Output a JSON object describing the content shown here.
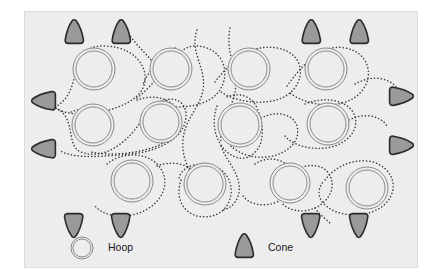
{
  "diagram": {
    "background_color": "#ededed",
    "border_color": "#dcdcdc",
    "panel": {
      "x": 24,
      "y": 11,
      "width": 394,
      "height": 257
    }
  },
  "legend": {
    "items": [
      {
        "icon": "hoop-icon",
        "label": "Hoop",
        "icon_x": 57,
        "icon_y": 236,
        "text_x": 83,
        "text_y": 236
      },
      {
        "icon": "cone-icon",
        "label": "Cone",
        "icon_x": 219,
        "icon_y": 234,
        "text_x": 243,
        "text_y": 236
      }
    ]
  },
  "styles": {
    "hoop_stroke": "#8a8a8a",
    "hoop_fill": "#ededed",
    "cone_fill": "#9a9a9a",
    "cone_stroke": "#2b2b2b",
    "path_dot_color": "#3c3c3c"
  },
  "chart_data": {
    "type": "diagram",
    "xlabel": "",
    "ylabel": "",
    "legend_position": "bottom-center",
    "grid": false,
    "hoops": [
      {
        "id": "h1",
        "cx": 69,
        "cy": 57,
        "r_outer": 21,
        "r_inner": 18,
        "row": "top"
      },
      {
        "id": "h2",
        "cx": 146,
        "cy": 57,
        "r_outer": 21,
        "r_inner": 18,
        "row": "top"
      },
      {
        "id": "h3",
        "cx": 224,
        "cy": 57,
        "r_outer": 21,
        "r_inner": 18,
        "row": "top"
      },
      {
        "id": "h4",
        "cx": 301,
        "cy": 57,
        "r_outer": 21,
        "r_inner": 18,
        "row": "top"
      },
      {
        "id": "h5",
        "cx": 68,
        "cy": 113,
        "r_outer": 21,
        "r_inner": 18,
        "row": "middle"
      },
      {
        "id": "h6",
        "cx": 136,
        "cy": 110,
        "r_outer": 21,
        "r_inner": 18,
        "row": "middle"
      },
      {
        "id": "h7",
        "cx": 215,
        "cy": 113,
        "r_outer": 22,
        "r_inner": 19,
        "row": "middle"
      },
      {
        "id": "h8",
        "cx": 303,
        "cy": 112,
        "r_outer": 21,
        "r_inner": 18,
        "row": "middle"
      },
      {
        "id": "h9",
        "cx": 107,
        "cy": 169,
        "r_outer": 21,
        "r_inner": 18,
        "row": "bottom"
      },
      {
        "id": "h10",
        "cx": 180,
        "cy": 172,
        "r_outer": 21,
        "r_inner": 18,
        "row": "bottom"
      },
      {
        "id": "h11",
        "cx": 265,
        "cy": 171,
        "r_outer": 20,
        "r_inner": 17,
        "row": "bottom"
      },
      {
        "id": "h12",
        "cx": 342,
        "cy": 176,
        "r_outer": 21,
        "r_inner": 18,
        "row": "bottom"
      }
    ],
    "cones": [
      {
        "id": "c1",
        "cx": 49,
        "cy": 20,
        "direction": "up",
        "side": "top"
      },
      {
        "id": "c2",
        "cx": 96,
        "cy": 20,
        "direction": "up",
        "side": "top"
      },
      {
        "id": "c3",
        "cx": 286,
        "cy": 20,
        "direction": "up",
        "side": "top"
      },
      {
        "id": "c4",
        "cx": 334,
        "cy": 20,
        "direction": "up",
        "side": "top"
      },
      {
        "id": "c5",
        "cx": 19,
        "cy": 89,
        "direction": "left",
        "side": "left"
      },
      {
        "id": "c6",
        "cx": 19,
        "cy": 137,
        "direction": "left",
        "side": "left"
      },
      {
        "id": "c7",
        "cx": 376,
        "cy": 84,
        "direction": "right",
        "side": "right"
      },
      {
        "id": "c8",
        "cx": 376,
        "cy": 133,
        "direction": "right",
        "side": "right"
      },
      {
        "id": "c9",
        "cx": 49,
        "cy": 213,
        "direction": "down",
        "side": "bottom"
      },
      {
        "id": "c10",
        "cx": 96,
        "cy": 213,
        "direction": "down",
        "side": "bottom"
      },
      {
        "id": "c11",
        "cx": 286,
        "cy": 213,
        "direction": "down",
        "side": "bottom"
      },
      {
        "id": "c12",
        "cx": 334,
        "cy": 213,
        "direction": "down",
        "side": "bottom"
      }
    ],
    "paths": [
      {
        "id": "p1",
        "d": "M 30 95 C 60 80 40 34 78 34 C 118 34 130 68 112 84 C 92 102 44 108 30 95 Z"
      },
      {
        "id": "p2",
        "d": "M 112 86 C 138 66 150 34 170 34 C 196 34 206 58 196 76 C 186 96 150 98 130 92"
      },
      {
        "id": "p3",
        "d": "M 172 18 C 164 40 182 56 178 78 C 174 98 160 106 158 128 C 156 152 170 162 172 180"
      },
      {
        "id": "p4",
        "d": "M 205 16 C 200 42 214 58 210 80 C 206 100 194 110 196 130"
      },
      {
        "id": "p5",
        "d": "M 190 70 C 210 44 230 32 252 36 C 276 40 282 62 268 78 C 252 96 214 92 196 80"
      },
      {
        "id": "p6",
        "d": "M 262 74 C 282 46 300 32 320 36 C 344 40 350 64 336 80 C 318 100 280 94 264 80"
      },
      {
        "id": "p7",
        "d": "M 330 72 C 348 62 364 66 372 76"
      },
      {
        "id": "p8",
        "d": "M 100 16 C 110 34 126 44 134 60"
      },
      {
        "id": "p9",
        "d": "M 150 36 C 136 46 124 58 118 72"
      },
      {
        "id": "p10",
        "d": "M 30 96 C 52 104 40 134 56 140 C 76 148 96 134 108 120 C 120 106 124 92 140 88 C 156 84 164 96 160 110 C 156 128 130 140 106 142 C 82 144 48 148 34 138"
      },
      {
        "id": "p11",
        "d": "M 112 88 C 128 82 146 86 152 98 C 158 112 148 128 132 134 C 112 142 84 144 66 140"
      },
      {
        "id": "p12",
        "d": "M 192 94 C 186 110 190 128 200 138 C 212 150 224 148 232 138 C 240 128 238 110 232 96 C 226 82 210 80 200 86"
      },
      {
        "id": "p13",
        "d": "M 236 106 C 252 98 268 102 272 114 C 276 128 264 140 248 144 C 230 148 214 142 206 134"
      },
      {
        "id": "p14",
        "d": "M 280 92 C 300 84 320 88 328 100 C 336 114 326 128 310 134 C 290 140 268 134 260 124"
      },
      {
        "id": "p15",
        "d": "M 324 108 C 340 100 356 104 362 114"
      },
      {
        "id": "p16",
        "d": "M 196 134 C 202 150 212 158 214 172 C 216 186 208 196 198 198"
      },
      {
        "id": "p17",
        "d": "M 82 152 C 96 140 120 140 132 152 C 146 166 140 186 124 196 C 106 208 80 206 70 194"
      },
      {
        "id": "p18",
        "d": "M 132 154 C 148 148 164 152 170 162"
      },
      {
        "id": "p19",
        "d": "M 156 168 C 150 186 158 200 172 204 C 190 208 204 198 206 182 C 208 164 194 152 178 152 C 164 152 156 158 154 166"
      },
      {
        "id": "p20",
        "d": "M 230 152 C 242 144 258 146 264 156 C 272 168 266 184 252 190 C 238 196 224 192 218 184"
      },
      {
        "id": "p21",
        "d": "M 268 160 C 282 150 298 152 304 162 C 312 174 304 190 290 196 C 276 202 262 198 256 190"
      },
      {
        "id": "p22",
        "d": "M 300 168 C 312 152 332 146 348 150 C 368 156 374 176 362 190 C 348 206 318 206 304 196 C 292 188 292 178 298 170"
      },
      {
        "id": "p23",
        "d": "M 290 196 C 296 204 302 208 306 212"
      },
      {
        "id": "p24",
        "d": "M 46 100 C 56 96 66 96 74 100"
      }
    ]
  }
}
